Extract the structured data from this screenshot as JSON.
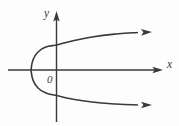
{
  "figure": {
    "kind": "coordinate-plane-graph",
    "background_color": "#fdfdfd",
    "stroke_color": "#3a3a3a",
    "width": 179,
    "height": 126,
    "axes": {
      "x_axis": {
        "label": "x",
        "icon": "arrow-right-icon",
        "label_x": 167,
        "label_y": 68
      },
      "y_axis": {
        "label": "y",
        "icon": "arrow-up-icon",
        "label_x": 44,
        "label_y": 17
      },
      "origin": {
        "label": "0",
        "label_x": 47,
        "label_y": 83
      }
    },
    "curve": {
      "name": "rightward-opening-parabola",
      "end_marker_upper": "arrow-right-icon",
      "end_marker_lower": "arrow-right-icon"
    }
  },
  "chart_data": {
    "type": "line",
    "title": "",
    "subtitle": "",
    "xlabel": "x",
    "ylabel": "y",
    "grid": false,
    "legend": null,
    "annotations": [
      "0"
    ],
    "axis_origin_px": [
      56.5,
      70
    ],
    "xlim_px": [
      8,
      163
    ],
    "ylim_px": [
      12,
      122
    ],
    "series": [
      {
        "name": "upper-branch",
        "description": "Upper half of a parabola opening to the right, drawn from the vertex rightward and upward, terminating in an arrowhead.",
        "points_px": [
          [
            31,
            70
          ],
          [
            33,
            60
          ],
          [
            38,
            52
          ],
          [
            46,
            47
          ],
          [
            56.5,
            45
          ],
          [
            72,
            41
          ],
          [
            92,
            37
          ],
          [
            116,
            34
          ],
          [
            138,
            32.5
          ],
          [
            152,
            32
          ]
        ]
      },
      {
        "name": "lower-branch",
        "description": "Lower half of a parabola opening to the right, drawn from the vertex rightward and downward, terminating in an arrowhead.",
        "points_px": [
          [
            31,
            70
          ],
          [
            33,
            80
          ],
          [
            38,
            88
          ],
          [
            46,
            93
          ],
          [
            56.5,
            95.5
          ],
          [
            72,
            99
          ],
          [
            92,
            102
          ],
          [
            116,
            104
          ],
          [
            138,
            105
          ],
          [
            152,
            105
          ]
        ]
      }
    ]
  }
}
